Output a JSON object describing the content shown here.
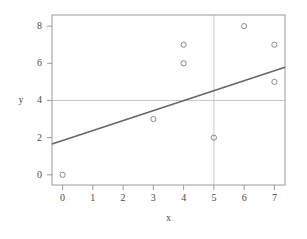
{
  "chart_data": {
    "type": "scatter",
    "title": "",
    "subtitle": "",
    "xlabel": "x",
    "ylabel": "y",
    "xlim": [
      -0.35,
      7.35
    ],
    "ylim": [
      -0.55,
      8.6
    ],
    "grid": false,
    "legend": null,
    "xticks": [
      0,
      1,
      2,
      3,
      4,
      5,
      6,
      7
    ],
    "xtick_labels": [
      "0",
      "1",
      "2",
      "3",
      "4",
      "5",
      "6",
      "7"
    ],
    "yticks": [
      0,
      2,
      4,
      6,
      8
    ],
    "ytick_labels": [
      "0",
      "2",
      "4",
      "6",
      "8"
    ],
    "points": [
      {
        "x": 0,
        "y": 0
      },
      {
        "x": 3,
        "y": 3
      },
      {
        "x": 4,
        "y": 7
      },
      {
        "x": 4,
        "y": 6
      },
      {
        "x": 5,
        "y": 2
      },
      {
        "x": 6,
        "y": 8
      },
      {
        "x": 7,
        "y": 7
      },
      {
        "x": 7,
        "y": 5
      }
    ],
    "fit_line": {
      "name": "regression-line",
      "intercept": 1.85,
      "slope": 0.536,
      "x_start": -0.35,
      "x_end": 7.35,
      "y_start": 1.66,
      "y_end": 5.79,
      "color": "#666666"
    },
    "reference_lines": [
      {
        "name": "horizontal-reference",
        "orientation": "horizontal",
        "value": 4,
        "color": "#c8c8c8"
      },
      {
        "name": "vertical-reference",
        "orientation": "vertical",
        "value": 5,
        "color": "#c8c8c8"
      }
    ],
    "marker": {
      "shape": "open-circle",
      "radius": 2.6,
      "stroke": "#8a8a8a",
      "fill": "none"
    },
    "frame": {
      "color": "#9a9a9a",
      "left": 52,
      "top": 15,
      "right": 285,
      "bottom": 185
    }
  }
}
